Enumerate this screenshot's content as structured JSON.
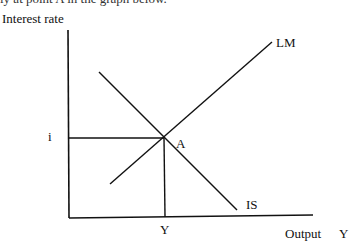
{
  "caption_fragment": "ly at point A in the graph below.",
  "diagram": {
    "y_axis_label": "Interest rate",
    "x_axis_label": "Output",
    "x_axis_symbol": "Y",
    "curves": [
      {
        "name": "LM",
        "label": "LM",
        "from": [
          110,
          184
        ],
        "to": [
          272,
          42
        ]
      },
      {
        "name": "IS",
        "label": "IS",
        "from": [
          99,
          72
        ],
        "to": [
          237,
          210
        ]
      }
    ],
    "equilibrium": {
      "label": "A",
      "x": 164,
      "y": 138
    },
    "y_tick_label": "i",
    "x_tick_label": "Y",
    "colors": {
      "line": "#111111",
      "background": "#ffffff"
    }
  }
}
